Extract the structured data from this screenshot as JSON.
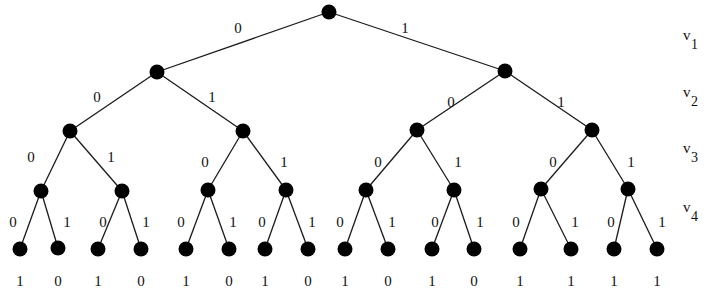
{
  "diagram": {
    "type": "binary-decision-tree",
    "node_color": "#000000",
    "edge_color": "#1a1a1a",
    "variables": [
      {
        "name": "v",
        "sub": "1",
        "x": 683,
        "y": 46
      },
      {
        "name": "v",
        "sub": "2",
        "x": 683,
        "y": 103
      },
      {
        "name": "v",
        "sub": "3",
        "x": 683,
        "y": 159
      },
      {
        "name": "v",
        "sub": "4",
        "x": 683,
        "y": 218
      }
    ],
    "nodes": [
      {
        "id": "r",
        "x": 329,
        "y": 12
      },
      {
        "id": "0",
        "x": 157,
        "y": 72
      },
      {
        "id": "1",
        "x": 505,
        "y": 71
      },
      {
        "id": "00",
        "x": 70,
        "y": 131
      },
      {
        "id": "01",
        "x": 243,
        "y": 131
      },
      {
        "id": "10",
        "x": 417,
        "y": 130
      },
      {
        "id": "11",
        "x": 592,
        "y": 130
      },
      {
        "id": "000",
        "x": 41,
        "y": 191
      },
      {
        "id": "001",
        "x": 122,
        "y": 191
      },
      {
        "id": "010",
        "x": 208,
        "y": 190
      },
      {
        "id": "011",
        "x": 286,
        "y": 190
      },
      {
        "id": "100",
        "x": 366,
        "y": 190
      },
      {
        "id": "101",
        "x": 454,
        "y": 190
      },
      {
        "id": "110",
        "x": 541,
        "y": 189
      },
      {
        "id": "111",
        "x": 628,
        "y": 189
      },
      {
        "id": "0000",
        "x": 20,
        "y": 249
      },
      {
        "id": "0001",
        "x": 58,
        "y": 248
      },
      {
        "id": "0010",
        "x": 98,
        "y": 249
      },
      {
        "id": "0011",
        "x": 141,
        "y": 249
      },
      {
        "id": "0100",
        "x": 186,
        "y": 249
      },
      {
        "id": "0101",
        "x": 229,
        "y": 249
      },
      {
        "id": "0110",
        "x": 265,
        "y": 249
      },
      {
        "id": "0111",
        "x": 308,
        "y": 249
      },
      {
        "id": "1000",
        "x": 345,
        "y": 249
      },
      {
        "id": "1001",
        "x": 388,
        "y": 249
      },
      {
        "id": "1010",
        "x": 432,
        "y": 249
      },
      {
        "id": "1011",
        "x": 474,
        "y": 249
      },
      {
        "id": "1100",
        "x": 520,
        "y": 249
      },
      {
        "id": "1101",
        "x": 571,
        "y": 249
      },
      {
        "id": "1110",
        "x": 614,
        "y": 249
      },
      {
        "id": "1111",
        "x": 657,
        "y": 249
      }
    ],
    "edges": [
      {
        "from": "r",
        "to": "0",
        "label": "0",
        "lx": 238,
        "ly": 33
      },
      {
        "from": "r",
        "to": "1",
        "label": "1",
        "lx": 405,
        "ly": 33
      },
      {
        "from": "0",
        "to": "00",
        "label": "0",
        "lx": 97,
        "ly": 102
      },
      {
        "from": "0",
        "to": "01",
        "label": "1",
        "lx": 212,
        "ly": 102
      },
      {
        "from": "1",
        "to": "10",
        "label": "0",
        "lx": 451,
        "ly": 107
      },
      {
        "from": "1",
        "to": "11",
        "label": "1",
        "lx": 561,
        "ly": 107
      },
      {
        "from": "00",
        "to": "000",
        "label": "0",
        "lx": 31,
        "ly": 162
      },
      {
        "from": "00",
        "to": "001",
        "label": "1",
        "lx": 111,
        "ly": 162
      },
      {
        "from": "01",
        "to": "010",
        "label": "0",
        "lx": 205,
        "ly": 167
      },
      {
        "from": "01",
        "to": "011",
        "label": "1",
        "lx": 284,
        "ly": 167
      },
      {
        "from": "10",
        "to": "100",
        "label": "0",
        "lx": 378,
        "ly": 167
      },
      {
        "from": "10",
        "to": "101",
        "label": "1",
        "lx": 458,
        "ly": 167
      },
      {
        "from": "11",
        "to": "110",
        "label": "0",
        "lx": 553,
        "ly": 167
      },
      {
        "from": "11",
        "to": "111",
        "label": "1",
        "lx": 631,
        "ly": 167
      },
      {
        "from": "000",
        "to": "0000",
        "label": "0",
        "lx": 13,
        "ly": 227
      },
      {
        "from": "000",
        "to": "0001",
        "label": "1",
        "lx": 67,
        "ly": 227
      },
      {
        "from": "001",
        "to": "0010",
        "label": "0",
        "lx": 103,
        "ly": 227
      },
      {
        "from": "001",
        "to": "0011",
        "label": "1",
        "lx": 146,
        "ly": 227
      },
      {
        "from": "010",
        "to": "0100",
        "label": "0",
        "lx": 181,
        "ly": 227
      },
      {
        "from": "010",
        "to": "0101",
        "label": "1",
        "lx": 233,
        "ly": 227
      },
      {
        "from": "011",
        "to": "0110",
        "label": "0",
        "lx": 262,
        "ly": 227
      },
      {
        "from": "011",
        "to": "0111",
        "label": "1",
        "lx": 312,
        "ly": 227
      },
      {
        "from": "100",
        "to": "1000",
        "label": "0",
        "lx": 340,
        "ly": 227
      },
      {
        "from": "100",
        "to": "1001",
        "label": "1",
        "lx": 392,
        "ly": 227
      },
      {
        "from": "101",
        "to": "1010",
        "label": "0",
        "lx": 435,
        "ly": 227
      },
      {
        "from": "101",
        "to": "1011",
        "label": "1",
        "lx": 480,
        "ly": 227
      },
      {
        "from": "110",
        "to": "1100",
        "label": "0",
        "lx": 516,
        "ly": 227
      },
      {
        "from": "110",
        "to": "1101",
        "label": "1",
        "lx": 575,
        "ly": 227
      },
      {
        "from": "111",
        "to": "1110",
        "label": "0",
        "lx": 611,
        "ly": 227
      },
      {
        "from": "111",
        "to": "1111",
        "label": "1",
        "lx": 662,
        "ly": 227
      }
    ],
    "leaf_values": [
      "1",
      "0",
      "1",
      "0",
      "1",
      "0",
      "1",
      "0",
      "1",
      "0",
      "1",
      "0",
      "1",
      "1",
      "1",
      "1"
    ],
    "leaf_value_y": 286
  }
}
